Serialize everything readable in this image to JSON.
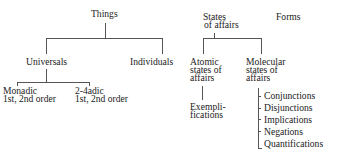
{
  "diagram": {
    "type": "tree",
    "nodes": {
      "things": "Things",
      "universals": "Universals",
      "individuals": "Individuals",
      "monadic": [
        "Monadic",
        "1st, 2nd order"
      ],
      "polyadic": [
        "2-4adic",
        "1st, 2nd order"
      ],
      "states_of_affairs": [
        "States",
        "of affairs"
      ],
      "forms": "Forms",
      "atomic": [
        "Atomic",
        "states of",
        "affairs"
      ],
      "molecular": [
        "Molecular",
        "states of",
        "affairs"
      ],
      "exemplifications": [
        "Exempli-",
        "fications"
      ],
      "molecular_forms": [
        "Conjunctions",
        "Disjunctions",
        "Implications",
        "Negations",
        "Quantifications"
      ]
    },
    "edges": [
      [
        "Things",
        "Universals"
      ],
      [
        "Things",
        "Individuals"
      ],
      [
        "Universals",
        "Monadic 1st, 2nd order"
      ],
      [
        "Universals",
        "2-4adic 1st, 2nd order"
      ],
      [
        "States of affairs",
        "Atomic states of affairs"
      ],
      [
        "States of affairs",
        "Molecular states of affairs"
      ],
      [
        "Atomic states of affairs",
        "Exemplifications"
      ],
      [
        "Molecular states of affairs",
        "Conjunctions"
      ],
      [
        "Molecular states of affairs",
        "Disjunctions"
      ],
      [
        "Molecular states of affairs",
        "Implications"
      ],
      [
        "Molecular states of affairs",
        "Negations"
      ],
      [
        "Molecular states of affairs",
        "Quantifications"
      ]
    ]
  }
}
